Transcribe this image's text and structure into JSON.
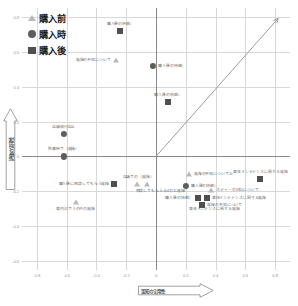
{
  "chart_data": {
    "type": "scatter",
    "title": "",
    "xlabel": "認知の実用性",
    "ylabel": "評価の実用性",
    "xlim": [
      -0.9,
      0.9
    ],
    "ylim": [
      -0.65,
      0.85
    ],
    "xticks": [
      "-0.8",
      "-0.6",
      "-0.4",
      "-0.2",
      "0",
      "0.2",
      "0.4",
      "0.6",
      "0.8"
    ],
    "xtick_values": [
      -0.8,
      -0.6,
      -0.4,
      -0.2,
      0,
      0.2,
      0.4,
      0.6,
      0.8
    ],
    "yticks": [
      "0.8",
      "0.6",
      "0.4",
      "0.2",
      "0",
      "-0.2",
      "-0.4",
      "-0.6"
    ],
    "ytick_values": [
      0.8,
      0.6,
      0.4,
      0.2,
      0,
      -0.2,
      -0.4,
      -0.6
    ],
    "grid": true,
    "legend_position": "top-left",
    "legend": [
      {
        "label": "購入前",
        "marker": "triangle",
        "color": "#b9b9b9"
      },
      {
        "label": "購入時",
        "marker": "circle",
        "color": "#5d5d5d"
      },
      {
        "label": "購入後",
        "marker": "square",
        "color": "#4f4f4f"
      }
    ],
    "annotations": [
      {
        "type": "arrow",
        "from": [
          0,
          0
        ],
        "to": [
          0.82,
          0.79
        ],
        "color": "#8a8a8a"
      }
    ],
    "series": [
      {
        "name": "購入前",
        "marker": "triangle",
        "points": [
          {
            "x": -0.27,
            "y": 0.55,
            "label": "故障の不知について",
            "label_pos": "left"
          },
          {
            "x": -0.54,
            "y": -0.26,
            "label": "車内はでうの中の故障",
            "label_pos": "below"
          },
          {
            "x": -0.13,
            "y": -0.16,
            "label": "",
            "label_pos": "right"
          },
          {
            "x": -0.06,
            "y": -0.16,
            "label": "",
            "label_pos": "right"
          },
          {
            "x": 0.22,
            "y": -0.1,
            "label": "故障の不知についてお",
            "label_pos": "right"
          },
          {
            "x": 0.37,
            "y": -0.19,
            "label": "スティーの対応について",
            "label_pos": "right"
          }
        ]
      },
      {
        "name": "購入時",
        "marker": "circle",
        "points": [
          {
            "x": -0.62,
            "y": 0.13,
            "label": "店舗停行記よ",
            "label_pos": "above"
          },
          {
            "x": -0.62,
            "y": 0.0,
            "label": "所事時で（故障）",
            "label_pos": "above"
          },
          {
            "x": -0.02,
            "y": 0.52,
            "label": "購入後の特典）",
            "label_pos": "right"
          },
          {
            "x": 0.2,
            "y": -0.17,
            "label": "購入後の特典）",
            "label_pos": "right"
          }
        ]
      },
      {
        "name": "購入後",
        "marker": "square",
        "points": [
          {
            "x": -0.24,
            "y": 0.72,
            "label": "購入後の特典）",
            "label_pos": "above"
          },
          {
            "x": 0.08,
            "y": 0.31,
            "label": "購入後の特典）",
            "label_pos": "above"
          },
          {
            "x": -0.28,
            "y": -0.16,
            "label": "購入後に相談してもらう故障",
            "label_pos": "left"
          },
          {
            "x": 0.28,
            "y": -0.24,
            "label": "購入後の特典）",
            "label_pos": "left"
          },
          {
            "x": 0.34,
            "y": -0.24,
            "label": "車体メンテナンスに関する故障",
            "label_pos": "right"
          },
          {
            "x": 0.31,
            "y": -0.28,
            "label": "故障の不知について",
            "label_pos": "right"
          },
          {
            "x": 0.7,
            "y": -0.13,
            "label": "車体メンテナンスに関する故障",
            "label_pos": "above"
          }
        ]
      }
    ],
    "floating_labels": [
      {
        "x": -0.12,
        "y": -0.12,
        "text": "店舗での（故障）",
        "align": "center"
      },
      {
        "x": 0.04,
        "y": -0.2,
        "text": "相談してもらえ点4のお故障）",
        "align": "center"
      },
      {
        "x": 0.22,
        "y": -0.3,
        "text": "車体メンテンスに関する故障",
        "align": "left"
      },
      {
        "x": -0.55,
        "y": -0.18,
        "text": "",
        "align": "left"
      }
    ]
  }
}
